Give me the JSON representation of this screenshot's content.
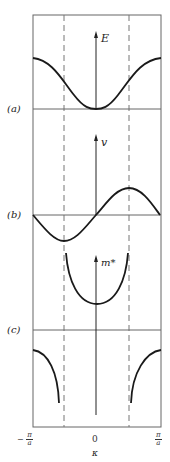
{
  "panels": [
    {
      "label": "(a)",
      "axis_label": "E",
      "description": "Energy E vs wavevector k"
    },
    {
      "label": "(b)",
      "axis_label": "v",
      "description": "Velocity v vs wavevector k"
    },
    {
      "label": "(c)",
      "axis_label": "m*",
      "description": "Effective mass m* vs wavevector k"
    }
  ],
  "x_axis": {
    "ticks": [
      {
        "sign": "−",
        "num": "π",
        "den": "a"
      },
      {
        "value": "0"
      },
      {
        "sign": "",
        "num": "π",
        "den": "a"
      }
    ],
    "label": "κ"
  },
  "colors": {
    "line": "#1a1a1a",
    "frame": "#555555",
    "dashed": "#666666"
  }
}
